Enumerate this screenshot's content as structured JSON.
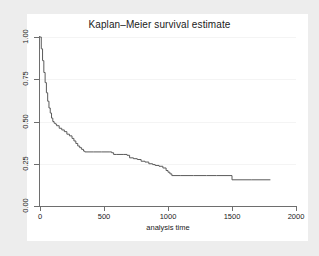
{
  "figure": {
    "background_color": "#ededed",
    "panel_color": "#ffffff",
    "axis_color": "#6e6e6e",
    "curve_color": "#5a5a5a",
    "grid_color": "#f4f4f4"
  },
  "title": "Kaplan–Meier survival estimate",
  "axes": {
    "x_title": "analysis time",
    "y_title": "",
    "x_ticks": [
      "0",
      "500",
      "1000",
      "1500",
      "2000"
    ],
    "y_ticks": [
      "0.00",
      "0.25",
      "0.50",
      "0.75",
      "1.00"
    ]
  },
  "chart_data": {
    "type": "line",
    "subtype": "kaplan-meier-step",
    "title": "Kaplan–Meier survival estimate",
    "xlabel": "analysis time",
    "ylabel": "",
    "xlim": [
      0,
      2000
    ],
    "ylim": [
      0,
      1.0
    ],
    "xticks": [
      0,
      500,
      1000,
      1500,
      2000
    ],
    "yticks": [
      0.0,
      0.25,
      0.5,
      0.75,
      1.0
    ],
    "grid": "faint horizontal gridlines at y ticks",
    "legend": "none",
    "series": [
      {
        "name": "survival estimate",
        "step": "post",
        "x": [
          0,
          10,
          20,
          30,
          40,
          50,
          60,
          70,
          80,
          90,
          100,
          110,
          120,
          130,
          150,
          170,
          190,
          210,
          230,
          250,
          265,
          280,
          295,
          310,
          325,
          340,
          350,
          420,
          480,
          540,
          560,
          575,
          600,
          650,
          680,
          700,
          730,
          760,
          790,
          820,
          850,
          880,
          900,
          930,
          960,
          985,
          1000,
          1015,
          1030,
          1100,
          1200,
          1300,
          1380,
          1500,
          1650,
          1800
        ],
        "y": [
          1.0,
          0.93,
          0.86,
          0.79,
          0.73,
          0.67,
          0.62,
          0.58,
          0.55,
          0.52,
          0.5,
          0.49,
          0.485,
          0.475,
          0.46,
          0.45,
          0.44,
          0.425,
          0.415,
          0.4,
          0.385,
          0.37,
          0.355,
          0.345,
          0.335,
          0.325,
          0.32,
          0.32,
          0.32,
          0.32,
          0.315,
          0.305,
          0.305,
          0.305,
          0.3,
          0.285,
          0.28,
          0.275,
          0.265,
          0.26,
          0.25,
          0.245,
          0.24,
          0.235,
          0.225,
          0.21,
          0.2,
          0.19,
          0.18,
          0.18,
          0.18,
          0.18,
          0.18,
          0.155,
          0.155,
          0.155
        ]
      }
    ]
  }
}
